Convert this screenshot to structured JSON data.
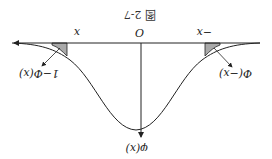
{
  "figure": {
    "caption": "图 2-7",
    "orientation": "rotated 180°",
    "labels": {
      "origin": "O",
      "neg_x": "−x",
      "pos_x": "x",
      "density": "φ(x)",
      "left_tail": "Φ(−x)",
      "right_tail": "1−Φ(x)"
    },
    "colors": {
      "line": "#222222",
      "shade": "#a9a9a9"
    }
  }
}
